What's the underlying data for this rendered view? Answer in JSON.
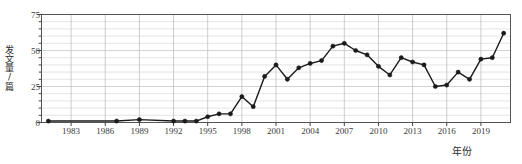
{
  "chart_data": {
    "type": "line",
    "title": "",
    "xlabel": "年份",
    "ylabel": "发文量/篇",
    "xlim": [
      1980.4,
      2021.6
    ],
    "ylim": [
      0,
      75
    ],
    "grid": true,
    "legend": null,
    "ytick_labels": [
      "0",
      "25",
      "50",
      "75"
    ],
    "ytick_values": [
      0,
      25,
      50,
      75
    ],
    "yminor_step": 5,
    "xtick_labels": [
      "1983",
      "1986",
      "1989",
      "1992",
      "1995",
      "1998",
      "2001",
      "2004",
      "2007",
      "2010",
      "2013",
      "2016",
      "2019"
    ],
    "xtick_values": [
      1983,
      1986,
      1989,
      1992,
      1995,
      1998,
      2001,
      2004,
      2007,
      2010,
      2013,
      2016,
      2019
    ],
    "marker": "circle",
    "line_color": "#1a1a1a",
    "marker_color": "#1a1a1a",
    "x": [
      1981,
      1987,
      1989,
      1992,
      1993,
      1994,
      1995,
      1996,
      1997,
      1998,
      1999,
      2000,
      2001,
      2002,
      2003,
      2004,
      2005,
      2006,
      2007,
      2008,
      2009,
      2010,
      2011,
      2012,
      2013,
      2014,
      2015,
      2016,
      2017,
      2018,
      2019,
      2020,
      2021
    ],
    "values": [
      1,
      1,
      2,
      1,
      1,
      1,
      4,
      6,
      6,
      18,
      11,
      32,
      40,
      30,
      38,
      41,
      43,
      53,
      55,
      50,
      47,
      39,
      33,
      45,
      42,
      40,
      25,
      26,
      35,
      30,
      44,
      45,
      62
    ],
    "series": [
      {
        "name": "发文量",
        "x": [
          1981,
          1987,
          1989,
          1992,
          1993,
          1994,
          1995,
          1996,
          1997,
          1998,
          1999,
          2000,
          2001,
          2002,
          2003,
          2004,
          2005,
          2006,
          2007,
          2008,
          2009,
          2010,
          2011,
          2012,
          2013,
          2014,
          2015,
          2016,
          2017,
          2018,
          2019,
          2020,
          2021
        ],
        "values": [
          1,
          1,
          2,
          1,
          1,
          1,
          4,
          6,
          6,
          18,
          11,
          32,
          40,
          30,
          38,
          41,
          43,
          53,
          55,
          50,
          47,
          39,
          33,
          45,
          42,
          40,
          25,
          26,
          35,
          30,
          44,
          45,
          62
        ]
      }
    ]
  },
  "axis": {
    "y_title": "发文量/篇",
    "x_title": "年份"
  }
}
